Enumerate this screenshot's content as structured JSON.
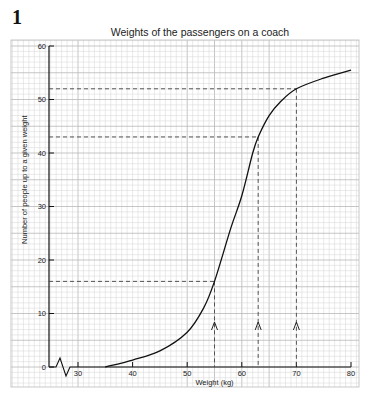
{
  "question_number": "1",
  "chart_data": {
    "type": "line",
    "title": "Weights of the passengers on a coach",
    "xlabel": "Weight (kg)",
    "ylabel": "Number of people up to a given weight",
    "xlim": [
      30,
      80
    ],
    "ylim": [
      0,
      60
    ],
    "x_ticks": [
      "30",
      "40",
      "50",
      "60",
      "70",
      "80"
    ],
    "y_ticks": [
      "0",
      "10",
      "20",
      "30",
      "40",
      "50",
      "60"
    ],
    "grid": true,
    "axis_break": "zigzag between 0 and 30 on x-axis",
    "series": [
      {
        "name": "cumulative frequency",
        "x": [
          35,
          40,
          45,
          50,
          53,
          55,
          58,
          60,
          62,
          63,
          65,
          67,
          70,
          75,
          80
        ],
        "values": [
          0,
          1.3,
          3,
          6.5,
          11,
          16,
          26,
          32,
          40,
          43,
          47,
          49.5,
          52,
          54,
          55.5
        ]
      }
    ],
    "annotations": [
      {
        "type": "dashed-guide",
        "x": 55,
        "y": 16,
        "arrow": "up"
      },
      {
        "type": "dashed-guide",
        "x": 63,
        "y": 43,
        "arrow": "up"
      },
      {
        "type": "dashed-guide",
        "x": 70,
        "y": 52,
        "arrow": "up"
      }
    ]
  }
}
